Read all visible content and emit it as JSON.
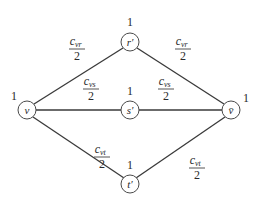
{
  "diagram": {
    "type": "graph",
    "nodes": [
      {
        "id": "v",
        "label": "v",
        "weight": "1",
        "cx": 27,
        "cy": 110
      },
      {
        "id": "r_prime",
        "label": "r′",
        "weight": "1",
        "cx": 130,
        "cy": 42
      },
      {
        "id": "s_prime",
        "label": "s′",
        "weight": "1",
        "cx": 130,
        "cy": 110
      },
      {
        "id": "v_bar",
        "label": "v̄",
        "weight": "1",
        "cx": 231,
        "cy": 110
      },
      {
        "id": "t_prime",
        "label": "t′",
        "weight": "1",
        "cx": 130,
        "cy": 184
      }
    ],
    "edges": [
      {
        "from": "v",
        "to": "r_prime",
        "label": {
          "numerator": "c",
          "subscript": "vr",
          "denominator": "2"
        }
      },
      {
        "from": "r_prime",
        "to": "v_bar",
        "label": {
          "numerator": "c",
          "subscript": "vr",
          "denominator": "2"
        }
      },
      {
        "from": "v",
        "to": "s_prime",
        "label": {
          "numerator": "c",
          "subscript": "vs",
          "denominator": "2"
        }
      },
      {
        "from": "s_prime",
        "to": "v_bar",
        "label": {
          "numerator": "c",
          "subscript": "vs",
          "denominator": "2"
        }
      },
      {
        "from": "v",
        "to": "t_prime",
        "label": {
          "numerator": "c",
          "subscript": "vt",
          "denominator": "2"
        }
      },
      {
        "from": "t_prime",
        "to": "v_bar",
        "label": {
          "numerator": "c",
          "subscript": "vt",
          "denominator": "2"
        }
      }
    ]
  }
}
